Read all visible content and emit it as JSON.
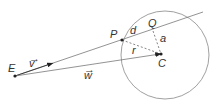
{
  "diagram": {
    "type": "ray-sphere intersection",
    "labels": {
      "E": "E",
      "P": "P",
      "Q": "Q",
      "C": "C",
      "d": "d",
      "a": "a",
      "r": "r",
      "v": "v",
      "w": "w",
      "vec_arrow": "→"
    },
    "colors": {
      "line": "#777777",
      "point": "#222222",
      "text": "#333333"
    }
  }
}
